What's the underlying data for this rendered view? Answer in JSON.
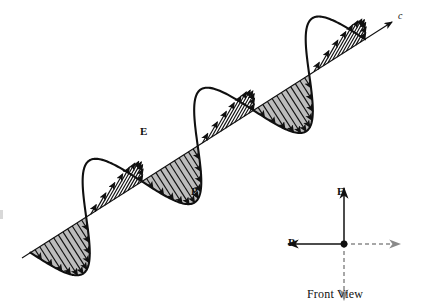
{
  "figure": {
    "kind": "electromagnetic-wave-diagram",
    "background_color": "#ffffff",
    "ink_color": "#101010",
    "e_field_fill": "#bcbcbc",
    "b_field_fill": "#ffffff"
  },
  "labels": {
    "e_field": "E",
    "b_field": "B",
    "propagation_speed": "c",
    "inset_e_field": "E",
    "inset_b_field": "B",
    "inset_caption": "Front View"
  },
  "axis": {
    "start_x": 22,
    "start_y": 258,
    "end_x": 392,
    "end_y": 22,
    "arrowhead": "open-arrow-tip",
    "label": "c"
  },
  "wave": {
    "cycles": 3,
    "period_px": 112,
    "amplitude_px": 46,
    "e_arrows_per_cycle": 12,
    "b_arrows_per_cycle": 12,
    "e_direction": "perpendicular-in-plane",
    "b_direction": "perpendicular-out-of-plane"
  },
  "inset": {
    "center_x": 344,
    "center_y": 244,
    "arm_length": 56,
    "arrows": [
      {
        "name": "e-up-arrow",
        "direction": "up",
        "style": "solid",
        "label": "E"
      },
      {
        "name": "b-left-arrow",
        "direction": "left",
        "style": "solid",
        "label": "B"
      },
      {
        "name": "e-down-arrow",
        "direction": "down",
        "style": "dashed",
        "label": ""
      },
      {
        "name": "b-right-arrow",
        "direction": "right",
        "style": "dashed",
        "label": ""
      }
    ],
    "origin_dot": true
  },
  "chart_data": {
    "type": "line",
    "xlabel": "propagation direction (c)",
    "ylabel": "field amplitude",
    "x": [
      0,
      0.25,
      0.5,
      0.75,
      1,
      1.25,
      1.5,
      1.75,
      2,
      2.25,
      2.5,
      2.75,
      3
    ],
    "series": [
      {
        "name": "E",
        "values": [
          0,
          1,
          0,
          -1,
          0,
          1,
          0,
          -1,
          0,
          1,
          0,
          -1,
          0
        ]
      },
      {
        "name": "B",
        "values": [
          0,
          1,
          0,
          -1,
          0,
          1,
          0,
          -1,
          0,
          1,
          0,
          -1,
          0
        ]
      }
    ],
    "legend": [
      "E",
      "B"
    ],
    "grid": false,
    "annotations": [
      "E",
      "B",
      "c",
      "Front View"
    ]
  }
}
